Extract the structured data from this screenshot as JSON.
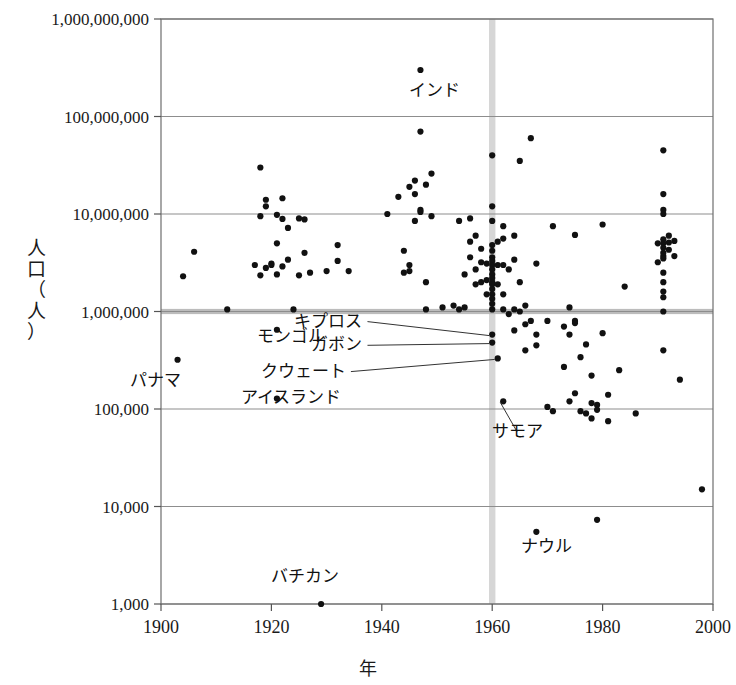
{
  "chart_data": {
    "type": "scatter",
    "title": "",
    "xlabel": "年",
    "ylabel": "人口（人）",
    "ylabel_chars": "人\n口\n（\n人\n）",
    "xlim": [
      1900,
      2000
    ],
    "ylim": [
      1000,
      1000000000
    ],
    "yscale": "log",
    "xscale": "linear",
    "grid": true,
    "legend": "none",
    "xticks": [
      "1900",
      "1920",
      "1940",
      "1960",
      "1980",
      "2000"
    ],
    "xtick_values": [
      1900,
      1920,
      1940,
      1960,
      1980,
      2000
    ],
    "yticks": [
      "1,000",
      "10,000",
      "100,000",
      "1,000,000",
      "10,000,000",
      "100,000,000",
      "1,000,000,000"
    ],
    "ytick_values": [
      1000,
      10000,
      100000,
      1000000,
      10000000,
      100000000,
      1000000000
    ],
    "reference_bands": [
      {
        "name": "year-1960-band",
        "orientation": "vertical",
        "value": 1960,
        "color": "#cfcfcf"
      },
      {
        "name": "population-1million-band",
        "orientation": "horizontal",
        "value": 1000000,
        "color": "#b5b5b5"
      }
    ],
    "annotations": [
      {
        "label": "インド",
        "x": 1947,
        "y": 300000000,
        "dx": 14,
        "dy": 26,
        "leader": false
      },
      {
        "label": "モンゴル",
        "x": 1921,
        "y": 650000,
        "dx": 14,
        "dy": 12,
        "leader": false
      },
      {
        "label": "パナマ",
        "x": 1903,
        "y": 320000,
        "dx": -22,
        "dy": 26,
        "leader": false
      },
      {
        "label": "アイスランド",
        "x": 1921,
        "y": 128000,
        "dx": 14,
        "dy": 4,
        "leader": false
      },
      {
        "label": "バチカン",
        "x": 1929,
        "y": 1000,
        "dx": -16,
        "dy": -22,
        "leader": false
      },
      {
        "label": "ナウル",
        "x": 1968,
        "y": 5500,
        "dx": 10,
        "dy": 20,
        "leader": false
      },
      {
        "label": "キプロス",
        "x": 1960,
        "y": 580000,
        "label_x": 1936.5,
        "label_y": 700000,
        "leader": true
      },
      {
        "label": "ガボン",
        "x": 1960,
        "y": 480000,
        "label_x": 1936.5,
        "label_y": 400000,
        "leader": true
      },
      {
        "label": "クウェート",
        "x": 1961,
        "y": 330000,
        "label_x": 1933.5,
        "label_y": 215000,
        "leader": true
      },
      {
        "label": "サモア",
        "x": 1962,
        "y": 120000,
        "label_x": 1964.5,
        "label_y": 52000,
        "leader": true
      }
    ],
    "points": [
      [
        1903,
        320000
      ],
      [
        1904,
        2300000
      ],
      [
        1906,
        4100000
      ],
      [
        1912,
        1050000
      ],
      [
        1917,
        3000000
      ],
      [
        1918,
        2350000
      ],
      [
        1918,
        9500000
      ],
      [
        1918,
        30000000
      ],
      [
        1919,
        14000000
      ],
      [
        1919,
        2800000
      ],
      [
        1919,
        12000000
      ],
      [
        1920,
        3000000
      ],
      [
        1920,
        3100000
      ],
      [
        1921,
        650000
      ],
      [
        1921,
        128000
      ],
      [
        1921,
        5000000
      ],
      [
        1921,
        9800000
      ],
      [
        1921,
        2400000
      ],
      [
        1922,
        14500000
      ],
      [
        1922,
        2900000
      ],
      [
        1922,
        8900000
      ],
      [
        1923,
        7200000
      ],
      [
        1923,
        3400000
      ],
      [
        1924,
        1050000
      ],
      [
        1925,
        2350000
      ],
      [
        1925,
        9000000
      ],
      [
        1926,
        4000000
      ],
      [
        1926,
        8800000
      ],
      [
        1927,
        2500000
      ],
      [
        1929,
        1000
      ],
      [
        1930,
        2600000
      ],
      [
        1932,
        3300000
      ],
      [
        1932,
        4800000
      ],
      [
        1934,
        2600000
      ],
      [
        1941,
        10000000
      ],
      [
        1943,
        15000000
      ],
      [
        1944,
        4200000
      ],
      [
        1944,
        2500000
      ],
      [
        1945,
        19000000
      ],
      [
        1945,
        3000000
      ],
      [
        1945,
        2600000
      ],
      [
        1946,
        8500000
      ],
      [
        1946,
        16000000
      ],
      [
        1946,
        22000000
      ],
      [
        1947,
        300000000
      ],
      [
        1947,
        70000000
      ],
      [
        1947,
        10500000
      ],
      [
        1947,
        11000000
      ],
      [
        1948,
        20000000
      ],
      [
        1948,
        2000000
      ],
      [
        1948,
        1050000
      ],
      [
        1949,
        26000000
      ],
      [
        1949,
        9500000
      ],
      [
        1951,
        1100000
      ],
      [
        1953,
        1150000
      ],
      [
        1954,
        8500000
      ],
      [
        1954,
        1050000
      ],
      [
        1955,
        2400000
      ],
      [
        1955,
        1100000
      ],
      [
        1956,
        9000000
      ],
      [
        1956,
        5200000
      ],
      [
        1956,
        3600000
      ],
      [
        1957,
        6000000
      ],
      [
        1957,
        2700000
      ],
      [
        1957,
        1900000
      ],
      [
        1958,
        3200000
      ],
      [
        1958,
        4400000
      ],
      [
        1958,
        2000000
      ],
      [
        1959,
        2100000
      ],
      [
        1959,
        3100000
      ],
      [
        1959,
        1500000
      ],
      [
        1960,
        40000000
      ],
      [
        1960,
        12000000
      ],
      [
        1960,
        8500000
      ],
      [
        1960,
        4800000
      ],
      [
        1960,
        4200000
      ],
      [
        1960,
        3600000
      ],
      [
        1960,
        3300000
      ],
      [
        1960,
        3000000
      ],
      [
        1960,
        2700000
      ],
      [
        1960,
        2400000
      ],
      [
        1960,
        2200000
      ],
      [
        1960,
        2000000
      ],
      [
        1960,
        1900000
      ],
      [
        1960,
        1700000
      ],
      [
        1960,
        1500000
      ],
      [
        1960,
        1350000
      ],
      [
        1960,
        1200000
      ],
      [
        1960,
        1050000
      ],
      [
        1960,
        580000
      ],
      [
        1960,
        480000
      ],
      [
        1961,
        5200000
      ],
      [
        1961,
        330000
      ],
      [
        1961,
        3000000
      ],
      [
        1961,
        1900000
      ],
      [
        1962,
        5600000
      ],
      [
        1962,
        3000000
      ],
      [
        1962,
        1500000
      ],
      [
        1962,
        120000
      ],
      [
        1962,
        7500000
      ],
      [
        1962,
        1050000
      ],
      [
        1963,
        2700000
      ],
      [
        1963,
        940000
      ],
      [
        1964,
        3400000
      ],
      [
        1964,
        6000000
      ],
      [
        1964,
        1050000
      ],
      [
        1964,
        640000
      ],
      [
        1965,
        1000000
      ],
      [
        1965,
        35000000
      ],
      [
        1965,
        2000000
      ],
      [
        1966,
        1150000
      ],
      [
        1966,
        740000
      ],
      [
        1966,
        400000
      ],
      [
        1967,
        60000000
      ],
      [
        1967,
        800000
      ],
      [
        1968,
        5500
      ],
      [
        1968,
        580000
      ],
      [
        1968,
        450000
      ],
      [
        1968,
        3100000
      ],
      [
        1970,
        800000
      ],
      [
        1970,
        105000
      ],
      [
        1971,
        7500000
      ],
      [
        1971,
        95000
      ],
      [
        1973,
        700000
      ],
      [
        1973,
        270000
      ],
      [
        1974,
        1100000
      ],
      [
        1974,
        580000
      ],
      [
        1974,
        120000
      ],
      [
        1975,
        6100000
      ],
      [
        1975,
        800000
      ],
      [
        1975,
        760000
      ],
      [
        1975,
        145000
      ],
      [
        1976,
        340000
      ],
      [
        1976,
        95000
      ],
      [
        1977,
        460000
      ],
      [
        1977,
        90000
      ],
      [
        1978,
        220000
      ],
      [
        1978,
        115000
      ],
      [
        1978,
        80000
      ],
      [
        1979,
        7300
      ],
      [
        1979,
        110000
      ],
      [
        1979,
        98000
      ],
      [
        1980,
        7800000
      ],
      [
        1980,
        600000
      ],
      [
        1981,
        140000
      ],
      [
        1981,
        75000
      ],
      [
        1983,
        250000
      ],
      [
        1984,
        1800000
      ],
      [
        1986,
        90000
      ],
      [
        1990,
        3200000
      ],
      [
        1990,
        5000000
      ],
      [
        1991,
        45000000
      ],
      [
        1991,
        16000000
      ],
      [
        1991,
        11000000
      ],
      [
        1991,
        10000000
      ],
      [
        1991,
        5500000
      ],
      [
        1991,
        5000000
      ],
      [
        1991,
        4500000
      ],
      [
        1991,
        4000000
      ],
      [
        1991,
        3700000
      ],
      [
        1991,
        3500000
      ],
      [
        1991,
        2500000
      ],
      [
        1991,
        2000000
      ],
      [
        1991,
        1600000
      ],
      [
        1991,
        1400000
      ],
      [
        1991,
        1000000
      ],
      [
        1991,
        400000
      ],
      [
        1992,
        6000000
      ],
      [
        1992,
        4300000
      ],
      [
        1992,
        5100000
      ],
      [
        1993,
        3700000
      ],
      [
        1993,
        5300000
      ],
      [
        1994,
        200000
      ],
      [
        1998,
        15000
      ]
    ]
  }
}
